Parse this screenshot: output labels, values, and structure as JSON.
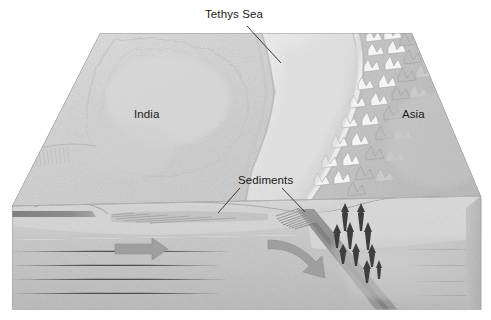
{
  "figure": {
    "type": "geological-block-diagram",
    "background_color": "#ffffff"
  },
  "labels": {
    "tethys_sea": "Tethys Sea",
    "india": "India",
    "asia": "Asia",
    "sediments": "Sediments"
  },
  "colors": {
    "land_india": "#d6d6d6",
    "sea_tethys": "#e6e6e6",
    "mountains_asia": "#c9c9c9",
    "crust_section": "#d2d2d2",
    "mantle_section": "#c4c4c4",
    "slab_dark": "#8e8e8e",
    "oceanic_crust_band": "#8a8a8a",
    "magma_arrow": "#3a3a3a",
    "motion_arrow": "#9a9a9a",
    "outline": "#8d8d8d",
    "label_text": "#1a1a1a"
  },
  "annotations": {
    "motion_arrow_india": "northward plate motion of India",
    "motion_arrow_subduction": "descending slab motion",
    "magma_arrows_count": 10,
    "magma_arrows_meaning": "rising magma beneath Asian margin"
  }
}
